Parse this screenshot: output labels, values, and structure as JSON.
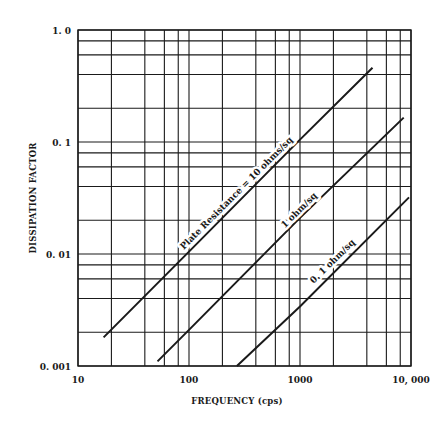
{
  "chart_data": {
    "type": "line",
    "title": "",
    "xlabel": "FREQUENCY (cps)",
    "ylabel": "DISSIPATION FACTOR",
    "xscale": "log",
    "yscale": "log",
    "xlim": [
      10,
      10000
    ],
    "ylim": [
      0.001,
      1.0
    ],
    "grid": true,
    "legend": "none (inline labels on lines)",
    "x_tick_labels": [
      "10",
      "100",
      "1000",
      "10, 000"
    ],
    "x_tick_values": [
      10,
      100,
      1000,
      10000
    ],
    "y_tick_labels": [
      "0. 001",
      "0. 01",
      "0. 1",
      "1. 0"
    ],
    "y_tick_values": [
      0.001,
      0.01,
      0.1,
      1.0
    ],
    "x_grid_values": [
      10,
      20,
      40,
      60,
      80,
      100,
      200,
      400,
      600,
      800,
      1000,
      2000,
      4000,
      6000,
      8000,
      10000
    ],
    "y_grid_values": [
      0.001,
      0.002,
      0.004,
      0.006,
      0.008,
      0.01,
      0.02,
      0.04,
      0.06,
      0.08,
      0.1,
      0.2,
      0.4,
      0.6,
      0.8,
      1.0
    ],
    "series": [
      {
        "name": "Plate Resistance = 10 ohms/sq",
        "label": "Plate Resistance = 10 ohms/sq",
        "x": [
          17,
          100,
          1000,
          4500
        ],
        "y": [
          0.0018,
          0.0105,
          0.105,
          0.46
        ]
      },
      {
        "name": "1 ohm/sq",
        "label": "1 ohm/sq",
        "x": [
          52,
          100,
          1000,
          8600
        ],
        "y": [
          0.0011,
          0.0021,
          0.021,
          0.165
        ]
      },
      {
        "name": "0.1 ohm/sq",
        "label": "0. 1 ohm/sq",
        "x": [
          270,
          1000,
          9600
        ],
        "y": [
          0.001,
          0.0034,
          0.032
        ]
      }
    ]
  },
  "colors": {
    "background": "#ffffff",
    "ink": "#1a1a1a"
  }
}
